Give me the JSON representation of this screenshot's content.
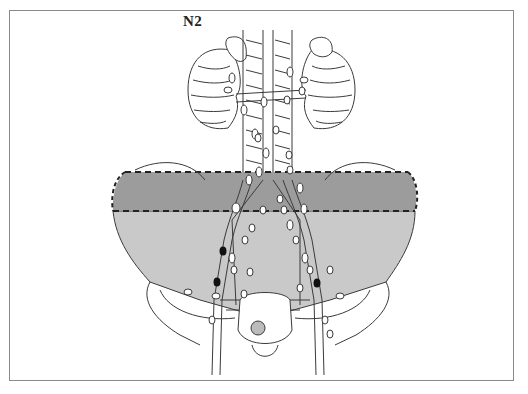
{
  "figure": {
    "stage_label": "N2",
    "colors": {
      "frame": "#8a8a8a",
      "band_fill": "#9c9c9c",
      "pelvis_fill": "#c9c9c9",
      "line": "#3a3a3a",
      "node_fill": "#ffffff",
      "positive_node_fill": "#111111"
    },
    "band": {
      "top": 172,
      "bottom": 211,
      "left": 113,
      "right": 415,
      "style": "dashed"
    },
    "positive_nodes": [
      {
        "x": 223,
        "y": 251
      },
      {
        "x": 217,
        "y": 282
      },
      {
        "x": 317,
        "y": 283
      }
    ]
  }
}
